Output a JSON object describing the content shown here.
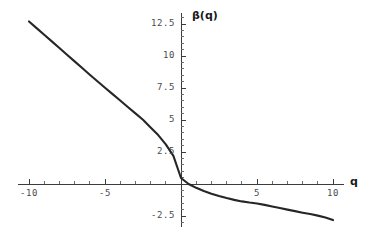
{
  "figure": {
    "background_color": "#ffffff",
    "curve_color": "#262626",
    "axis_color": "#3c3c3c",
    "tick_label_color": "#4a4a4a",
    "axis_label_color": "#1a1a1a"
  },
  "labels": {
    "ylabel": "β(q)",
    "xlabel": "q"
  },
  "xticks": [
    {
      "value": -10,
      "label": "-10"
    },
    {
      "value": -5,
      "label": "-5"
    },
    {
      "value": 5,
      "label": "5"
    },
    {
      "value": 10,
      "label": "10"
    }
  ],
  "yticks": [
    {
      "value": 12.5,
      "label": "12.5"
    },
    {
      "value": 10,
      "label": "10"
    },
    {
      "value": 7.5,
      "label": "7.5"
    },
    {
      "value": 5,
      "label": "5"
    },
    {
      "value": 2.5,
      "label": "2.5"
    },
    {
      "value": -2.5,
      "label": "-2.5"
    }
  ],
  "chart_data": {
    "type": "line",
    "title": "",
    "subtitle": "",
    "xlabel": "q",
    "ylabel": "β(q)",
    "xlim": [
      -10.6,
      10.6
    ],
    "ylim": [
      -3.2,
      13.2
    ],
    "xticks": [
      -10,
      -5,
      5,
      10
    ],
    "xtick_labels": [
      "-10",
      "-5",
      "5",
      "10"
    ],
    "yticks": [
      12.5,
      10,
      7.5,
      5,
      2.5,
      -2.5
    ],
    "ytick_labels": [
      "12.5",
      "10",
      "7.5",
      "5",
      "2.5",
      "-2.5"
    ],
    "x_minor_tick_step": 1,
    "y_minor_tick_step": 0.5,
    "grid": false,
    "legend": false,
    "legend_position": "none",
    "axes_style": "centered-cross-at-origin",
    "series": [
      {
        "name": "β(q)",
        "color": "#262626",
        "line_width": 2.1,
        "x": [
          -10,
          -9.5,
          -9,
          -8.5,
          -8,
          -7.5,
          -7,
          -6.5,
          -6,
          -5.5,
          -5,
          -4.5,
          -4,
          -3.5,
          -3,
          -2.5,
          -2,
          -1.5,
          -1,
          -0.5,
          0,
          0.5,
          1,
          1.5,
          2,
          2.5,
          3,
          3.5,
          4,
          4.5,
          5,
          5.5,
          6,
          6.5,
          7,
          7.5,
          8,
          8.5,
          9,
          9.5,
          10
        ],
        "values": [
          12.7,
          12.18,
          11.66,
          11.14,
          10.62,
          10.1,
          9.58,
          9.06,
          8.54,
          8.03,
          7.52,
          7.02,
          6.52,
          6.02,
          5.52,
          5.02,
          4.42,
          3.82,
          3.1,
          2.2,
          0.47,
          0.0,
          -0.3,
          -0.55,
          -0.76,
          -0.94,
          -1.1,
          -1.24,
          -1.36,
          -1.45,
          -1.52,
          -1.63,
          -1.76,
          -1.88,
          -2.0,
          -2.12,
          -2.24,
          -2.35,
          -2.47,
          -2.62,
          -2.82
        ]
      }
    ],
    "annotations": []
  }
}
